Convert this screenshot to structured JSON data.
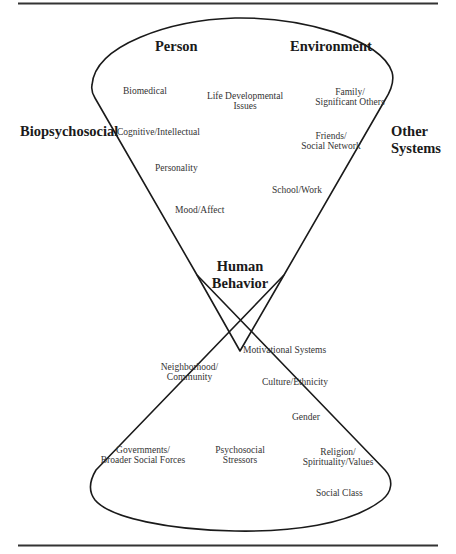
{
  "diagram": {
    "type": "hourglass-systems-diagram",
    "center": {
      "title_line1": "Human",
      "title_line2": "Behavior"
    },
    "side_labels": {
      "left": "Biopsychosocial",
      "right_line1": "Other",
      "right_line2": "Systems"
    },
    "top_lobe": {
      "left_heading": "Person",
      "right_heading": "Environment",
      "inner_core": {
        "line1": "Life Developmental",
        "line2": "Issues"
      },
      "person_factors": [
        "Biomedical",
        "Cognitive/Intellectual",
        "Personality",
        "Mood/Affect"
      ],
      "environment_factors": [
        {
          "line1": "Family/",
          "line2": "Significant Others"
        },
        {
          "line1": "Friends/",
          "line2": "Social Network"
        },
        {
          "line1": "School/Work",
          "line2": ""
        }
      ]
    },
    "bottom_lobe": {
      "inner_core": {
        "line1": "Psychosocial",
        "line2": "Stressors"
      },
      "left_factors": [
        {
          "line1": "Neighborhood/",
          "line2": "Community"
        },
        {
          "line1": "Governments/",
          "line2": "Broader Social Forces"
        }
      ],
      "right_factors": [
        "Motivational Systems",
        "Culture/Ethnicity",
        "Gender",
        {
          "line1": "Religion/",
          "line2": "Spirituality/Values"
        },
        "Social Class"
      ]
    },
    "connectors": "double-headed arrows link adjacent factors; arrows run around the inner core loops",
    "colors": {
      "line": "#1a1a1a",
      "text": "#333333",
      "background": "#ffffff"
    }
  }
}
